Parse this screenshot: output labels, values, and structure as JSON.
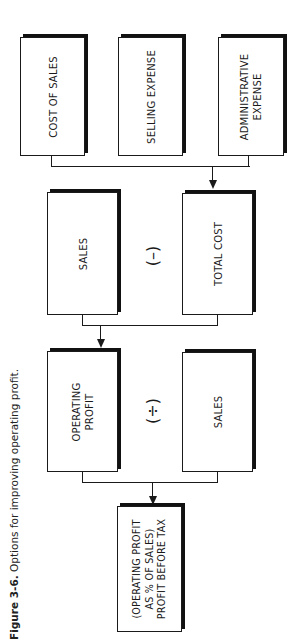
{
  "caption": {
    "label": "Figure 3-6.",
    "text": "Options for improving operating profit."
  },
  "row1": {
    "cost_of_sales": "COST OF SALES",
    "selling_expense": "SELLING EXPENSE",
    "administrative_expense": [
      "ADMINISTRATIVE",
      "EXPENSE"
    ]
  },
  "row2": {
    "sales": "SALES",
    "operator": "(–)",
    "total_cost": "TOTAL COST"
  },
  "row3": {
    "operating_profit": [
      "OPERATING",
      "PROFIT"
    ],
    "operator": "(÷)",
    "sales": "SALES"
  },
  "result": {
    "lines": [
      "(OPERATING PROFIT",
      "AS % OF SALES)",
      "PROFIT BEFORE TAX"
    ]
  },
  "colors": {
    "stroke": "#1a1a1a",
    "background": "#ffffff"
  }
}
